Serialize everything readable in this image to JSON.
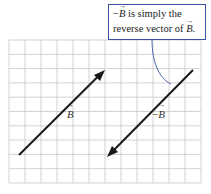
{
  "callout": {
    "line1_prefix": "−",
    "line1_vec": "B",
    "line1_rest": " is simply the",
    "line2_text": "reverse vector of ",
    "line2_vec": "B",
    "line2_end": "."
  },
  "labels": {
    "b_vector": "B",
    "neg_b_prefix": "−",
    "neg_b_vector": "B"
  },
  "colors": {
    "grid": "#c8c8c8",
    "arrow": "#1a1a1a",
    "callout_border": "#3a4fa8",
    "pointer": "#4a6aa8"
  },
  "grid": {
    "x0": 9,
    "y0": 40,
    "x1": 201,
    "y1": 183,
    "columns": 12,
    "rows": 10
  },
  "vectors": [
    {
      "name": "B",
      "tail": [
        19,
        155
      ],
      "tip": [
        105,
        70
      ]
    },
    {
      "name": "-B",
      "tail": [
        193,
        70
      ],
      "tip": [
        107,
        157
      ]
    }
  ]
}
